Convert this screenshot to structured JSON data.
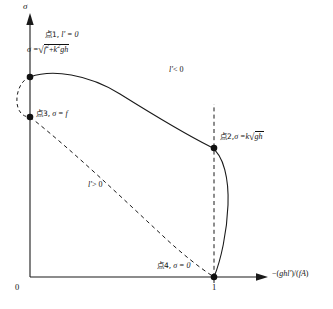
{
  "figure": {
    "type": "schematic-curve-diagram",
    "background_color": "#ffffff",
    "line_color": "#1a1a1a",
    "axes": {
      "y_axis_symbol": "σ",
      "x_axis_label_parts": {
        "minus": "−(",
        "numerator": "ghl'",
        "slash": ")/(",
        "denominator": "fA",
        "close": ")"
      },
      "x_axis_label_full": "−(ghl')/(fA)",
      "origin_tick": "0",
      "unit_tick": "1"
    },
    "points": [
      {
        "id": "point-1",
        "cjk_prefix": "点1,",
        "condition": "l' = 0",
        "formula_lhs": "σ =",
        "formula_radicand_a": "f",
        "formula_radicand_a_exp": "2",
        "formula_radicand_plus": "+",
        "formula_radicand_b": "k",
        "formula_radicand_b_exp": "2",
        "formula_radicand_c": "gh",
        "formula_full": "σ = √(f² + k²gh)",
        "x": 0,
        "y_desc": "sqrt(f^2 + k^2 g h)"
      },
      {
        "id": "point-2",
        "cjk_prefix": "点2,",
        "formula_lhs": "σ =",
        "formula_k": "k",
        "formula_radicand": "gh",
        "formula_full": "σ = k√(gh)",
        "x": 1,
        "y_desc": "k sqrt(g h)"
      },
      {
        "id": "point-3",
        "cjk_prefix": "点3,",
        "formula_full": "σ = f",
        "formula_lhs": "σ =",
        "formula_rhs": "f",
        "x": 0,
        "y_desc": "f"
      },
      {
        "id": "point-4",
        "cjk_prefix": "点4,",
        "formula_full": "σ = 0",
        "formula_lhs": "σ =",
        "formula_rhs": "0",
        "x": 1,
        "y_desc": "0"
      }
    ],
    "regions": [
      {
        "id": "region-upper",
        "label_sym": "l'",
        "label_rel": "< 0",
        "label_full": "l' < 0",
        "curve_style": "solid"
      },
      {
        "id": "region-lower",
        "label_sym": "l'",
        "label_rel": "> 0",
        "label_full": "l' > 0",
        "curve_style": "dashed"
      }
    ],
    "curves": [
      {
        "id": "solid-curve",
        "style": "solid",
        "from": "point-1",
        "to": "point-4",
        "through": "point-2"
      },
      {
        "id": "dashed-curve-lower",
        "style": "dashed",
        "from": "point-3",
        "to": "point-4"
      },
      {
        "id": "dashed-arc-left",
        "style": "dashed",
        "from": "point-1",
        "to": "point-3"
      },
      {
        "id": "dashed-vertical-unit",
        "style": "dashed",
        "from": "point-2",
        "to": "point-4"
      }
    ]
  }
}
